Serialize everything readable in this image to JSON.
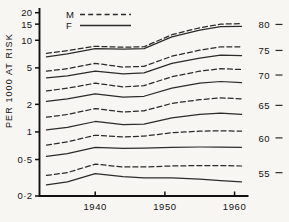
{
  "chart_data": {
    "type": "line",
    "title": "",
    "xlabel": "",
    "ylabel": "PER 1000 AT RISK",
    "xlim": [
      1932,
      1962
    ],
    "ylim": [
      0.2,
      22
    ],
    "yscale": "log",
    "grid": false,
    "legend_position": "top-center",
    "legend": [
      {
        "label": "M",
        "style": "dashed",
        "meaning": "Male"
      },
      {
        "label": "F",
        "style": "solid",
        "meaning": "Female"
      }
    ],
    "y_ticks": [
      {
        "label": "20",
        "value": 20
      },
      {
        "label": "15",
        "value": 15
      },
      {
        "label": "10",
        "value": 10
      },
      {
        "label": "5",
        "value": 5
      },
      {
        "label": "2",
        "value": 2
      },
      {
        "label": "1",
        "value": 1
      },
      {
        "label": "0·5",
        "value": 0.5
      },
      {
        "label": "0·2",
        "value": 0.2
      }
    ],
    "x_ticks": [
      {
        "label": "1940",
        "value": 1940
      },
      {
        "label": "1950",
        "value": 1950
      },
      {
        "label": "1960",
        "value": 1960
      }
    ],
    "age_group_labels": [
      {
        "label": "80",
        "value": 80
      },
      {
        "label": "75",
        "value": 75
      },
      {
        "label": "70",
        "value": 70
      },
      {
        "label": "65",
        "value": 65
      },
      {
        "label": "60",
        "value": 60
      },
      {
        "label": "55",
        "value": 55
      }
    ],
    "x": [
      1933,
      1936,
      1940,
      1944,
      1947,
      1951,
      1955,
      1958,
      1961
    ],
    "series": [
      {
        "name": "M 80",
        "sex": "M",
        "age_group": 80,
        "style": "dashed",
        "values": [
          7.2,
          7.7,
          8.6,
          8.4,
          8.5,
          11.5,
          13.7,
          15.0,
          15.2
        ]
      },
      {
        "name": "F 80",
        "sex": "F",
        "age_group": 80,
        "style": "solid",
        "values": [
          6.6,
          7.1,
          8.1,
          8.0,
          8.1,
          10.9,
          12.9,
          14.1,
          14.2
        ]
      },
      {
        "name": "M 75",
        "sex": "M",
        "age_group": 75,
        "style": "dashed",
        "values": [
          4.6,
          4.9,
          5.6,
          5.1,
          5.2,
          6.7,
          7.8,
          8.5,
          8.5
        ]
      },
      {
        "name": "F 75",
        "sex": "F",
        "age_group": 75,
        "style": "solid",
        "values": [
          3.9,
          4.1,
          4.6,
          4.3,
          4.4,
          5.6,
          6.4,
          6.9,
          6.8
        ]
      },
      {
        "name": "M 70",
        "sex": "M",
        "age_group": 70,
        "style": "dashed",
        "values": [
          2.8,
          3.0,
          3.4,
          3.1,
          3.2,
          4.0,
          4.6,
          4.9,
          4.8
        ]
      },
      {
        "name": "F 70",
        "sex": "F",
        "age_group": 70,
        "style": "solid",
        "values": [
          2.15,
          2.3,
          2.6,
          2.4,
          2.45,
          3.0,
          3.4,
          3.55,
          3.45
        ]
      },
      {
        "name": "M 65",
        "sex": "M",
        "age_group": 65,
        "style": "dashed",
        "values": [
          1.45,
          1.55,
          1.8,
          1.65,
          1.7,
          2.05,
          2.25,
          2.35,
          2.3
        ]
      },
      {
        "name": "F 65",
        "sex": "F",
        "age_group": 65,
        "style": "solid",
        "values": [
          1.05,
          1.12,
          1.3,
          1.2,
          1.22,
          1.42,
          1.55,
          1.6,
          1.55
        ]
      },
      {
        "name": "M 60",
        "sex": "M",
        "age_group": 60,
        "style": "dashed",
        "values": [
          0.72,
          0.78,
          0.92,
          0.88,
          0.9,
          0.98,
          1.02,
          1.03,
          1.02
        ]
      },
      {
        "name": "F 60",
        "sex": "F",
        "age_group": 60,
        "style": "solid",
        "values": [
          0.54,
          0.58,
          0.68,
          0.66,
          0.665,
          0.68,
          0.685,
          0.685,
          0.68
        ]
      },
      {
        "name": "M 55",
        "sex": "M",
        "age_group": 55,
        "style": "dashed",
        "values": [
          0.335,
          0.36,
          0.445,
          0.415,
          0.415,
          0.425,
          0.43,
          0.43,
          0.425
        ]
      },
      {
        "name": "F 55",
        "sex": "F",
        "age_group": 55,
        "style": "solid",
        "values": [
          0.265,
          0.285,
          0.35,
          0.325,
          0.315,
          0.315,
          0.305,
          0.295,
          0.285
        ]
      }
    ]
  }
}
